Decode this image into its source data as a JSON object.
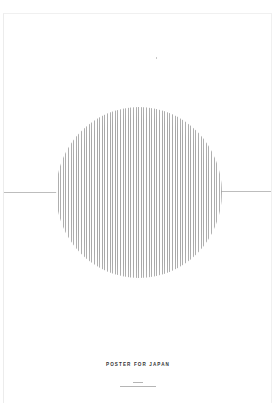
{
  "poster": {
    "title": "POSTER FOR JAPAN",
    "caption_line_1": "",
    "caption_line_2": "",
    "colors": {
      "background": "#ffffff",
      "stripes": "#9a9a9a",
      "horizon_line": "#bdbdbd",
      "title_text": "#333333"
    },
    "graphic": {
      "shape": "circle",
      "fill": "vertical-stripes",
      "horizon": "horizontal-line"
    }
  }
}
